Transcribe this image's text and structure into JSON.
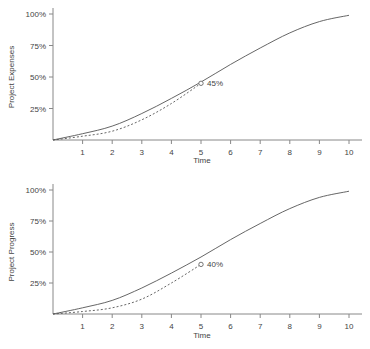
{
  "chart_data": [
    {
      "type": "line",
      "title": "",
      "xlabel": "Time",
      "ylabel": "Project Expenses",
      "x": [
        0,
        1,
        2,
        3,
        4,
        5,
        6,
        7,
        8,
        9,
        10
      ],
      "x_ticks": [
        "1",
        "2",
        "3",
        "4",
        "5",
        "6",
        "7",
        "8",
        "9",
        "10"
      ],
      "y_ticks": [
        "25%",
        "50%",
        "75%",
        "100%"
      ],
      "ylim": [
        0,
        100
      ],
      "xlim": [
        0,
        10.4
      ],
      "grid": false,
      "series": [
        {
          "name": "Planned",
          "style": "solid",
          "x": [
            0,
            1,
            2,
            3,
            4,
            5,
            6,
            7,
            8,
            9,
            10
          ],
          "values": [
            0,
            5,
            11,
            21,
            33,
            46,
            60,
            73,
            85,
            94,
            99
          ]
        },
        {
          "name": "Actual",
          "style": "dashed",
          "x": [
            0,
            1,
            2,
            3,
            4,
            5
          ],
          "values": [
            0,
            3,
            7,
            16,
            29,
            45
          ]
        }
      ],
      "annotations": [
        {
          "x": 5,
          "y": 45,
          "text": "45%",
          "marker": "circle"
        }
      ]
    },
    {
      "type": "line",
      "title": "",
      "xlabel": "Time",
      "ylabel": "Project Progress",
      "x": [
        0,
        1,
        2,
        3,
        4,
        5,
        6,
        7,
        8,
        9,
        10
      ],
      "x_ticks": [
        "1",
        "2",
        "3",
        "4",
        "5",
        "6",
        "7",
        "8",
        "9",
        "10"
      ],
      "y_ticks": [
        "25%",
        "50%",
        "75%",
        "100%"
      ],
      "ylim": [
        0,
        100
      ],
      "xlim": [
        0,
        10.4
      ],
      "grid": false,
      "series": [
        {
          "name": "Planned",
          "style": "solid",
          "x": [
            0,
            1,
            2,
            3,
            4,
            5,
            6,
            7,
            8,
            9,
            10
          ],
          "values": [
            0,
            5,
            11,
            21,
            33,
            46,
            60,
            73,
            85,
            94,
            99
          ]
        },
        {
          "name": "Actual",
          "style": "dashed",
          "x": [
            0,
            1,
            2,
            3,
            4,
            5
          ],
          "values": [
            0,
            2,
            5,
            12,
            25,
            40
          ]
        }
      ],
      "annotations": [
        {
          "x": 5,
          "y": 40,
          "text": "40%",
          "marker": "circle"
        }
      ]
    }
  ],
  "colors": {
    "line": "#555555",
    "axis": "#888888",
    "text": "#444444"
  }
}
